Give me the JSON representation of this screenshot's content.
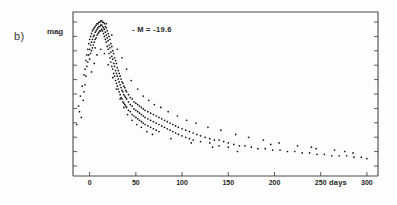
{
  "figure": {
    "panel_label": "b)",
    "y_axis_label": "mag",
    "x_axis_label": "days",
    "annotation": "- M = -19.6"
  },
  "chart_data": {
    "type": "scatter",
    "title": "",
    "subtitle": "",
    "xlabel": "days",
    "ylabel": "mag",
    "annotations": [
      "- M = -19.6"
    ],
    "panel": "b)",
    "grid": false,
    "legend": null,
    "xlim": [
      -18,
      312
    ],
    "ylim_note": "magnitude axis inverted (brighter up), ticks unlabeled except 'mag'",
    "xticks": [
      0,
      50,
      100,
      150,
      200,
      250,
      300
    ],
    "xticklabels": [
      "0",
      "50",
      "100",
      "150",
      "200",
      "250",
      "300"
    ],
    "yticks_labeled": [
      "mag"
    ],
    "y_tick_count": 11,
    "peak_day": 13,
    "peak_magnitude_label": "-19.6",
    "points": [
      [
        -12,
        0.62
      ],
      [
        -10,
        0.55
      ],
      [
        -9,
        0.7
      ],
      [
        -8,
        0.48
      ],
      [
        -7,
        0.58
      ],
      [
        -6,
        0.4
      ],
      [
        -6,
        0.52
      ],
      [
        -5,
        0.36
      ],
      [
        -5,
        0.47
      ],
      [
        -4,
        0.3
      ],
      [
        -4,
        0.41
      ],
      [
        -3,
        0.26
      ],
      [
        -3,
        0.34
      ],
      [
        -2,
        0.22
      ],
      [
        -2,
        0.31
      ],
      [
        -1,
        0.18
      ],
      [
        -1,
        0.26
      ],
      [
        0,
        0.15
      ],
      [
        0,
        0.22
      ],
      [
        0,
        0.29
      ],
      [
        1,
        0.13
      ],
      [
        1,
        0.19
      ],
      [
        1,
        0.25
      ],
      [
        2,
        0.11
      ],
      [
        2,
        0.17
      ],
      [
        2,
        0.23
      ],
      [
        3,
        0.09
      ],
      [
        3,
        0.15
      ],
      [
        3,
        0.21
      ],
      [
        4,
        0.08
      ],
      [
        4,
        0.13
      ],
      [
        4,
        0.19
      ],
      [
        5,
        0.07
      ],
      [
        5,
        0.12
      ],
      [
        5,
        0.17
      ],
      [
        6,
        0.06
      ],
      [
        6,
        0.1
      ],
      [
        6,
        0.15
      ],
      [
        7,
        0.05
      ],
      [
        7,
        0.09
      ],
      [
        7,
        0.14
      ],
      [
        8,
        0.04
      ],
      [
        8,
        0.08
      ],
      [
        8,
        0.12
      ],
      [
        9,
        0.04
      ],
      [
        9,
        0.07
      ],
      [
        9,
        0.11
      ],
      [
        10,
        0.03
      ],
      [
        10,
        0.06
      ],
      [
        10,
        0.1
      ],
      [
        11,
        0.03
      ],
      [
        11,
        0.06
      ],
      [
        11,
        0.09
      ],
      [
        12,
        0.02
      ],
      [
        12,
        0.05
      ],
      [
        12,
        0.09
      ],
      [
        13,
        0.02
      ],
      [
        13,
        0.05
      ],
      [
        13,
        0.08
      ],
      [
        14,
        0.03
      ],
      [
        14,
        0.06
      ],
      [
        14,
        0.09
      ],
      [
        15,
        0.03
      ],
      [
        15,
        0.07
      ],
      [
        15,
        0.11
      ],
      [
        16,
        0.04
      ],
      [
        16,
        0.08
      ],
      [
        16,
        0.13
      ],
      [
        17,
        0.06
      ],
      [
        17,
        0.1
      ],
      [
        17,
        0.15
      ],
      [
        18,
        0.07
      ],
      [
        18,
        0.12
      ],
      [
        18,
        0.17
      ],
      [
        19,
        0.09
      ],
      [
        19,
        0.14
      ],
      [
        19,
        0.2
      ],
      [
        20,
        0.11
      ],
      [
        20,
        0.16
      ],
      [
        20,
        0.22
      ],
      [
        21,
        0.13
      ],
      [
        21,
        0.19
      ],
      [
        21,
        0.25
      ],
      [
        22,
        0.15
      ],
      [
        22,
        0.21
      ],
      [
        22,
        0.28
      ],
      [
        23,
        0.18
      ],
      [
        23,
        0.24
      ],
      [
        23,
        0.31
      ],
      [
        24,
        0.2
      ],
      [
        24,
        0.27
      ],
      [
        24,
        0.34
      ],
      [
        25,
        0.23
      ],
      [
        25,
        0.29
      ],
      [
        25,
        0.36
      ],
      [
        26,
        0.25
      ],
      [
        26,
        0.32
      ],
      [
        26,
        0.39
      ],
      [
        27,
        0.28
      ],
      [
        27,
        0.34
      ],
      [
        27,
        0.41
      ],
      [
        28,
        0.3
      ],
      [
        28,
        0.37
      ],
      [
        28,
        0.44
      ],
      [
        29,
        0.32
      ],
      [
        29,
        0.39
      ],
      [
        29,
        0.46
      ],
      [
        30,
        0.35
      ],
      [
        30,
        0.41
      ],
      [
        30,
        0.48
      ],
      [
        31,
        0.37
      ],
      [
        31,
        0.43
      ],
      [
        31,
        0.5
      ],
      [
        32,
        0.39
      ],
      [
        32,
        0.45
      ],
      [
        32,
        0.52
      ],
      [
        33,
        0.41
      ],
      [
        33,
        0.47
      ],
      [
        33,
        0.54
      ],
      [
        34,
        0.43
      ],
      [
        34,
        0.49
      ],
      [
        34,
        0.56
      ],
      [
        35,
        0.45
      ],
      [
        35,
        0.51
      ],
      [
        35,
        0.57
      ],
      [
        36,
        0.46
      ],
      [
        36,
        0.52
      ],
      [
        36,
        0.59
      ],
      [
        37,
        0.48
      ],
      [
        37,
        0.54
      ],
      [
        37,
        0.6
      ],
      [
        38,
        0.49
      ],
      [
        38,
        0.55
      ],
      [
        38,
        0.61
      ],
      [
        39,
        0.51
      ],
      [
        39,
        0.56
      ],
      [
        39,
        0.62
      ],
      [
        40,
        0.52
      ],
      [
        40,
        0.57
      ],
      [
        40,
        0.63
      ],
      [
        42,
        0.54
      ],
      [
        42,
        0.59
      ],
      [
        42,
        0.65
      ],
      [
        44,
        0.56
      ],
      [
        44,
        0.61
      ],
      [
        44,
        0.66
      ],
      [
        46,
        0.57
      ],
      [
        46,
        0.62
      ],
      [
        46,
        0.68
      ],
      [
        48,
        0.59
      ],
      [
        48,
        0.64
      ],
      [
        48,
        0.69
      ],
      [
        50,
        0.6
      ],
      [
        50,
        0.65
      ],
      [
        50,
        0.7
      ],
      [
        52,
        0.61
      ],
      [
        52,
        0.66
      ],
      [
        52,
        0.71
      ],
      [
        54,
        0.62
      ],
      [
        54,
        0.67
      ],
      [
        54,
        0.72
      ],
      [
        56,
        0.63
      ],
      [
        56,
        0.68
      ],
      [
        56,
        0.73
      ],
      [
        58,
        0.64
      ],
      [
        58,
        0.69
      ],
      [
        58,
        0.74
      ],
      [
        60,
        0.65
      ],
      [
        60,
        0.7
      ],
      [
        60,
        0.75
      ],
      [
        63,
        0.66
      ],
      [
        63,
        0.71
      ],
      [
        63,
        0.76
      ],
      [
        66,
        0.67
      ],
      [
        66,
        0.72
      ],
      [
        66,
        0.77
      ],
      [
        69,
        0.68
      ],
      [
        69,
        0.73
      ],
      [
        69,
        0.78
      ],
      [
        72,
        0.69
      ],
      [
        72,
        0.74
      ],
      [
        72,
        0.79
      ],
      [
        75,
        0.7
      ],
      [
        75,
        0.75
      ],
      [
        75,
        0.8
      ],
      [
        78,
        0.71
      ],
      [
        78,
        0.76
      ],
      [
        81,
        0.72
      ],
      [
        81,
        0.77
      ],
      [
        84,
        0.73
      ],
      [
        84,
        0.78
      ],
      [
        87,
        0.74
      ],
      [
        87,
        0.79
      ],
      [
        90,
        0.75
      ],
      [
        90,
        0.8
      ],
      [
        93,
        0.76
      ],
      [
        93,
        0.81
      ],
      [
        96,
        0.77
      ],
      [
        96,
        0.82
      ],
      [
        100,
        0.78
      ],
      [
        100,
        0.83
      ],
      [
        104,
        0.79
      ],
      [
        104,
        0.84
      ],
      [
        108,
        0.8
      ],
      [
        108,
        0.85
      ],
      [
        112,
        0.81
      ],
      [
        112,
        0.86
      ],
      [
        116,
        0.82
      ],
      [
        120,
        0.83
      ],
      [
        120,
        0.87
      ],
      [
        125,
        0.84
      ],
      [
        130,
        0.85
      ],
      [
        130,
        0.88
      ],
      [
        135,
        0.86
      ],
      [
        140,
        0.86
      ],
      [
        140,
        0.9
      ],
      [
        145,
        0.87
      ],
      [
        150,
        0.88
      ],
      [
        150,
        0.91
      ],
      [
        156,
        0.89
      ],
      [
        162,
        0.9
      ],
      [
        168,
        0.9
      ],
      [
        175,
        0.91
      ],
      [
        182,
        0.92
      ],
      [
        190,
        0.92
      ],
      [
        198,
        0.93
      ],
      [
        206,
        0.93
      ],
      [
        214,
        0.94
      ],
      [
        222,
        0.94
      ],
      [
        230,
        0.95
      ],
      [
        238,
        0.95
      ],
      [
        246,
        0.96
      ],
      [
        254,
        0.96
      ],
      [
        262,
        0.97
      ],
      [
        270,
        0.97
      ],
      [
        278,
        0.97
      ],
      [
        286,
        0.98
      ],
      [
        294,
        0.98
      ],
      [
        300,
        0.99
      ],
      [
        30,
        0.22
      ],
      [
        35,
        0.28
      ],
      [
        40,
        0.36
      ],
      [
        45,
        0.44
      ],
      [
        52,
        0.5
      ],
      [
        58,
        0.55
      ],
      [
        64,
        0.58
      ],
      [
        70,
        0.61
      ],
      [
        77,
        0.63
      ],
      [
        85,
        0.66
      ],
      [
        95,
        0.69
      ],
      [
        105,
        0.72
      ],
      [
        115,
        0.74
      ],
      [
        128,
        0.77
      ],
      [
        142,
        0.79
      ],
      [
        158,
        0.82
      ],
      [
        172,
        0.84
      ],
      [
        188,
        0.86
      ],
      [
        205,
        0.88
      ],
      [
        225,
        0.9
      ],
      [
        245,
        0.92
      ],
      [
        265,
        0.93
      ],
      [
        285,
        0.95
      ],
      [
        5,
        0.32
      ],
      [
        8,
        0.26
      ],
      [
        12,
        0.22
      ],
      [
        16,
        0.25
      ],
      [
        20,
        0.33
      ],
      [
        25,
        0.42
      ],
      [
        29,
        0.5
      ],
      [
        33,
        0.57
      ],
      [
        37,
        0.63
      ],
      [
        41,
        0.68
      ],
      [
        46,
        0.72
      ],
      [
        51,
        0.75
      ],
      [
        56,
        0.77
      ],
      [
        62,
        0.8
      ],
      [
        68,
        0.82
      ],
      [
        -14,
        0.75
      ],
      [
        -11,
        0.66
      ],
      [
        2,
        0.38
      ],
      [
        6,
        0.21
      ],
      [
        18,
        0.04
      ],
      [
        24,
        0.12
      ],
      [
        88,
        0.85
      ],
      [
        110,
        0.88
      ],
      [
        133,
        0.91
      ],
      [
        160,
        0.94
      ],
      [
        196,
        0.89
      ],
      [
        240,
        0.91
      ],
      [
        276,
        0.94
      ]
    ]
  }
}
